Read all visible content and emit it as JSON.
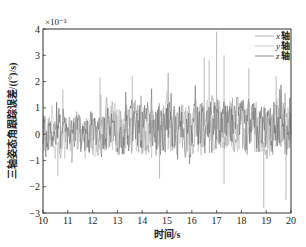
{
  "chart_data": {
    "type": "line",
    "title": "",
    "xlabel": "时间/s",
    "ylabel": "三轴姿态角跟踪误差/((°)/s)",
    "y_exponent_label": "×10⁻³",
    "xlim": [
      10,
      20
    ],
    "ylim": [
      -3,
      4
    ],
    "y_scale": 0.001,
    "xticks": [
      "10",
      "11",
      "12",
      "13",
      "14",
      "15",
      "16",
      "17",
      "18",
      "19",
      "20"
    ],
    "yticks": [
      "-3",
      "-2",
      "-1",
      "0",
      "1",
      "2",
      "3",
      "4"
    ],
    "grid": false,
    "legend_position": "upper right",
    "series": [
      {
        "name": "x 轴",
        "axis_letter": "x",
        "suffix": "轴",
        "color": "#9a9a9a",
        "width": 0.6
      },
      {
        "name": "y 轴",
        "axis_letter": "y",
        "suffix": "轴",
        "color": "#bdbdbd",
        "width": 0.6
      },
      {
        "name": "z 轴",
        "axis_letter": "z",
        "suffix": "轴",
        "color": "#6f6f6f",
        "width": 0.6
      }
    ],
    "envelope_description": "Noisy high-frequency signals centered near 0 (×10⁻³). From t=10 to ~12.5 amplitude roughly -1.7 to +1.7; from ~12.5 to 20 amplitude increases to about -2 to +2.3 with occasional spikes.",
    "notable_points": [
      {
        "t": 10.8,
        "value": 1.7
      },
      {
        "t": 12.3,
        "value": 2.15
      },
      {
        "t": 13.6,
        "value": 2.2
      },
      {
        "t": 16.5,
        "value": 2.9
      },
      {
        "t": 16.7,
        "value": 2.8
      },
      {
        "t": 17.0,
        "value": 3.9
      },
      {
        "t": 17.3,
        "value": 3.0
      },
      {
        "t": 18.3,
        "value": 2.5
      },
      {
        "t": 19.4,
        "value": 2.2
      },
      {
        "t": 10.6,
        "value": -1.6
      },
      {
        "t": 14.7,
        "value": -1.7
      },
      {
        "t": 17.3,
        "value": -1.9
      },
      {
        "t": 18.9,
        "value": -2.8
      },
      {
        "t": 19.8,
        "value": -2.5
      }
    ]
  }
}
